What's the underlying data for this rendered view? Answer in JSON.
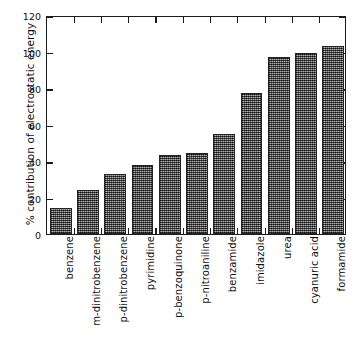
{
  "chart_data": {
    "type": "bar",
    "title": "",
    "xlabel": "",
    "ylabel": "% contribution of electrostatic energy",
    "ylim": [
      0,
      120
    ],
    "ytick_values": [
      0,
      20,
      40,
      60,
      80,
      100,
      120
    ],
    "ytick_labels": [
      "0",
      "20",
      "40",
      "60",
      "80",
      "100",
      "120"
    ],
    "grid": false,
    "legend": null,
    "categories": [
      "benzene",
      "m-dinitrobenzene",
      "p-dinitrobenzene",
      "pyrimidine",
      "p-benzoquinone",
      "p-nitroaniline",
      "benzamide",
      "imidazole",
      "urea",
      "cyanuric acid",
      "formamide"
    ],
    "values": [
      14,
      24,
      33,
      38,
      43.5,
      44.5,
      55,
      77,
      97,
      99,
      103
    ],
    "bar_color": "#5d5d5d",
    "bar_edge_color": "#242424",
    "axis_color": "#1c1c1c",
    "background_color": "#ffffff"
  }
}
